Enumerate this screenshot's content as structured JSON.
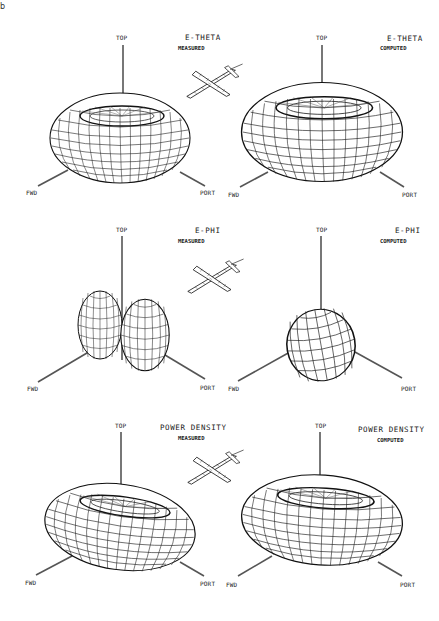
{
  "page": {
    "corner_mark": "b"
  },
  "axis_labels": {
    "top": "TOP",
    "fwd": "FWD",
    "port": "PORT"
  },
  "panels": [
    {
      "id": "etheta-measured",
      "row": 1,
      "col": 1,
      "title": "E-THETA",
      "subtitle": "MEASURED",
      "shape": "torus-flattened"
    },
    {
      "id": "etheta-computed",
      "row": 1,
      "col": 2,
      "title": "E-THETA",
      "subtitle": "COMPUTED",
      "shape": "torus"
    },
    {
      "id": "ephi-measured",
      "row": 2,
      "col": 1,
      "title": "E-PHI",
      "subtitle": "MEASURED",
      "shape": "two-lobe"
    },
    {
      "id": "ephi-computed",
      "row": 2,
      "col": 2,
      "title": "E-PHI",
      "subtitle": "COMPUTED",
      "shape": "single-lobe"
    },
    {
      "id": "power-measured",
      "row": 3,
      "col": 1,
      "title": "POWER DENSITY",
      "subtitle": "MEASURED",
      "shape": "torus-flattened"
    },
    {
      "id": "power-computed",
      "row": 3,
      "col": 2,
      "title": "POWER DENSITY",
      "subtitle": "COMPUTED",
      "shape": "torus"
    }
  ],
  "aircraft_icons": [
    {
      "row": 1,
      "label": "aircraft orientation"
    },
    {
      "row": 2,
      "label": "aircraft orientation"
    },
    {
      "row": 3,
      "label": "aircraft orientation"
    }
  ],
  "colors": {
    "ink": "#1a1a1a",
    "axis": "#555555",
    "paper": "#ffffff"
  }
}
